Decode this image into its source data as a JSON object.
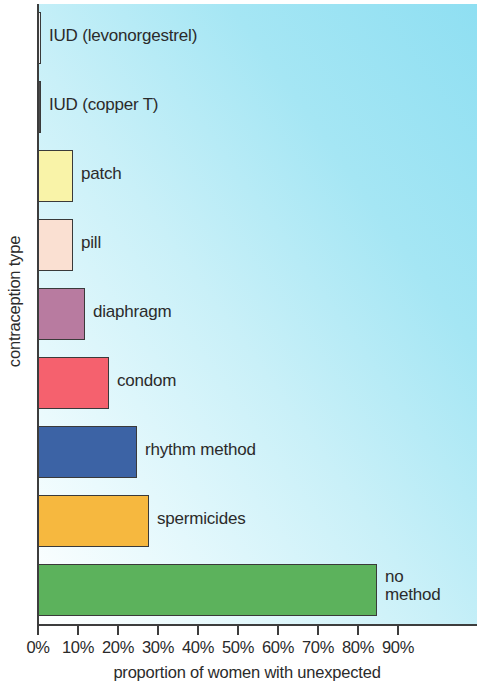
{
  "chart_data": {
    "type": "bar",
    "orientation": "horizontal",
    "title": "",
    "xlabel": "proportion of women with unexpected",
    "ylabel": "contraception type",
    "xlim": [
      0,
      95
    ],
    "grid": false,
    "legend": "none",
    "axis_color": "#3d3d3d",
    "background_gradient": [
      "#ffffff",
      "#8fdff2"
    ],
    "xticks": [
      0,
      10,
      20,
      30,
      40,
      50,
      60,
      70,
      80,
      90
    ],
    "xtick_labels": [
      "0%",
      "10%",
      "20%",
      "30%",
      "40%",
      "50%",
      "60%",
      "70%",
      "80%",
      "90%"
    ],
    "categories": [
      "IUD (levonorgestrel)",
      "IUD (copper T)",
      "patch",
      "pill",
      "diaphragm",
      "condom",
      "rhythm method",
      "spermicides",
      "no method"
    ],
    "values": [
      0.2,
      0.8,
      9,
      9,
      12,
      18,
      25,
      28,
      85
    ],
    "bar_colors": [
      "#f2f2f2",
      "#4a4a4a",
      "#f9f3a8",
      "#fae0d2",
      "#b87ba0",
      "#f5616e",
      "#3c63a5",
      "#f6b83f",
      "#5cb25c"
    ],
    "bars": [
      {
        "label": "IUD (levonorgestrel)",
        "value": 0.2,
        "color": "#f2f2f2"
      },
      {
        "label": "IUD (copper T)",
        "value": 0.8,
        "color": "#4a4a4a"
      },
      {
        "label": "patch",
        "value": 9,
        "color": "#f9f3a8"
      },
      {
        "label": "pill",
        "value": 9,
        "color": "#fae0d2"
      },
      {
        "label": "diaphragm",
        "value": 12,
        "color": "#b87ba0"
      },
      {
        "label": "condom",
        "value": 18,
        "color": "#f5616e"
      },
      {
        "label": "rhythm method",
        "value": 25,
        "color": "#3c63a5"
      },
      {
        "label": "spermicides",
        "value": 28,
        "color": "#f6b83f"
      },
      {
        "label": "no method",
        "value": 85,
        "color": "#5cb25c"
      }
    ]
  },
  "axes": {
    "y_title": "contraception type",
    "x_title": "proportion of women with unexpected"
  }
}
